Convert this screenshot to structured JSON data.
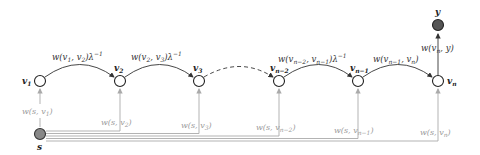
{
  "diagram": {
    "type": "chain graph",
    "nodes": [
      {
        "id": "v1",
        "label": "v",
        "sub": "1",
        "x": 40,
        "y": 81
      },
      {
        "id": "v2",
        "label": "v",
        "sub": "2",
        "x": 120,
        "y": 81
      },
      {
        "id": "v3",
        "label": "v",
        "sub": "3",
        "x": 199,
        "y": 81
      },
      {
        "id": "vn-2",
        "label": "v",
        "sub": "n−2",
        "x": 279,
        "y": 81
      },
      {
        "id": "vn-1",
        "label": "v",
        "sub": "n−1",
        "x": 358,
        "y": 81
      },
      {
        "id": "vn",
        "label": "v",
        "sub": "n",
        "x": 438,
        "y": 81
      }
    ],
    "special_nodes": {
      "source": {
        "label": "s",
        "x": 40,
        "y": 134,
        "fill": "#888888"
      },
      "target": {
        "label": "y",
        "x": 438,
        "y": 25,
        "fill": "#555555"
      }
    },
    "chain_edges": [
      {
        "from": "v1",
        "to": "v2",
        "label": "w(v₁, v₂)λ⁻¹",
        "style": "solid"
      },
      {
        "from": "v2",
        "to": "v3",
        "label": "w(v₂, v₃)λ⁻¹",
        "style": "solid"
      },
      {
        "from": "v3",
        "to": "vn-2",
        "label": "",
        "style": "dashed"
      },
      {
        "from": "vn-2",
        "to": "vn-1",
        "label": "w(vₙ₋₂, vₙ₋₁)λ⁻¹",
        "style": "solid"
      },
      {
        "from": "vn-1",
        "to": "vn",
        "label": "w(vₙ₋₁, vₙ)",
        "style": "solid"
      }
    ],
    "output_edge": {
      "from": "vn",
      "to": "y",
      "label": "w(vₙ, y)"
    },
    "source_edges": [
      {
        "to": "v1",
        "label": "w(s, v₁)"
      },
      {
        "to": "v2",
        "label": "w(s, v₂)"
      },
      {
        "to": "v3",
        "label": "w(s, v₃)"
      },
      {
        "to": "vn-2",
        "label": "w(s, vₙ₋₂)"
      },
      {
        "to": "vn-1",
        "label": "w(s, vₙ₋₁)"
      },
      {
        "to": "vn",
        "label": "w(s, vₙ)"
      }
    ],
    "colors": {
      "edge": "#333333",
      "source_edge": "#aaaaaa",
      "node_stroke": "#222222"
    }
  }
}
